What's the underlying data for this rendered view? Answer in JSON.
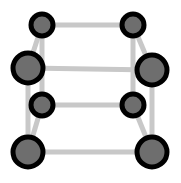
{
  "figure": {
    "width": 181,
    "height": 183,
    "background_color": "#ffffff"
  },
  "style": {
    "edge_color": "#c8c8c8",
    "edge_width": 5,
    "node_fill": "#6e6e6e",
    "node_stroke": "#000000",
    "node_stroke_width": 5
  },
  "graph_data": {
    "type": "graph",
    "name": "Q3 cube graph",
    "vertex_count": 8,
    "edge_count": 12,
    "nodes": [
      {
        "id": "back-top-left",
        "label": "",
        "x": 42,
        "y": 25,
        "r": 11,
        "face": "back"
      },
      {
        "id": "back-top-right",
        "label": "",
        "x": 133,
        "y": 25,
        "r": 11,
        "face": "back"
      },
      {
        "id": "back-bottom-left",
        "label": "",
        "x": 42,
        "y": 105,
        "r": 11,
        "face": "back"
      },
      {
        "id": "back-bottom-right",
        "label": "",
        "x": 133,
        "y": 105,
        "r": 11,
        "face": "back"
      },
      {
        "id": "front-top-left",
        "label": "",
        "x": 28,
        "y": 68,
        "r": 15,
        "face": "front"
      },
      {
        "id": "front-top-right",
        "label": "",
        "x": 152,
        "y": 70,
        "r": 15,
        "face": "front"
      },
      {
        "id": "front-bottom-left",
        "label": "",
        "x": 28,
        "y": 152,
        "r": 15,
        "face": "front"
      },
      {
        "id": "front-bottom-right",
        "label": "",
        "x": 152,
        "y": 152,
        "r": 15,
        "face": "front"
      }
    ],
    "edges": [
      {
        "id": "e-back-top",
        "from": "back-top-left",
        "to": "back-top-right",
        "kind": "back"
      },
      {
        "id": "e-back-left",
        "from": "back-top-left",
        "to": "back-bottom-left",
        "kind": "back"
      },
      {
        "id": "e-back-right",
        "from": "back-top-right",
        "to": "back-bottom-right",
        "kind": "back"
      },
      {
        "id": "e-back-bottom",
        "from": "back-bottom-left",
        "to": "back-bottom-right",
        "kind": "back"
      },
      {
        "id": "e-front-top",
        "from": "front-top-left",
        "to": "front-top-right",
        "kind": "front"
      },
      {
        "id": "e-front-left",
        "from": "front-top-left",
        "to": "front-bottom-left",
        "kind": "front"
      },
      {
        "id": "e-front-right",
        "from": "front-top-right",
        "to": "front-bottom-right",
        "kind": "front"
      },
      {
        "id": "e-front-bottom",
        "from": "front-bottom-left",
        "to": "front-bottom-right",
        "kind": "front"
      },
      {
        "id": "e-connect-tl",
        "from": "back-top-left",
        "to": "front-top-left",
        "kind": "depth"
      },
      {
        "id": "e-connect-tr",
        "from": "back-top-right",
        "to": "front-top-right",
        "kind": "depth"
      },
      {
        "id": "e-connect-bl",
        "from": "back-bottom-left",
        "to": "front-bottom-left",
        "kind": "depth"
      },
      {
        "id": "e-connect-br",
        "from": "back-bottom-right",
        "to": "front-bottom-right",
        "kind": "depth"
      }
    ]
  }
}
